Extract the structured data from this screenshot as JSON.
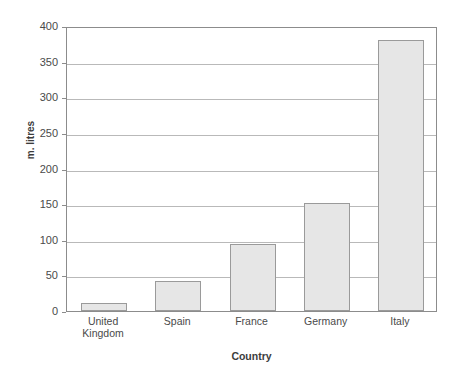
{
  "chart_data": {
    "type": "bar",
    "title": "",
    "xlabel": "Country",
    "ylabel": "m. litres",
    "categories": [
      "United Kingdom",
      "Spain",
      "France",
      "Germany",
      "Italy"
    ],
    "category_lines": [
      [
        "United",
        "Kingdom"
      ],
      [
        "Spain"
      ],
      [
        "France"
      ],
      [
        "Germany"
      ],
      [
        "Italy"
      ]
    ],
    "values": [
      11,
      42,
      94,
      151,
      380
    ],
    "ylim": [
      0,
      400
    ],
    "ytick_values": [
      0,
      50,
      100,
      150,
      200,
      250,
      300,
      350,
      400
    ],
    "ytick_labels": [
      "0",
      "50",
      "100",
      "150",
      "200",
      "250",
      "300",
      "350",
      "400"
    ],
    "grid": true,
    "legend": false,
    "bar_fill": "#e6e6e6",
    "bar_border": "#9a9a9a",
    "gridline_color": "#b9b9b9",
    "axis_color": "#8c8c8c",
    "background": "#ffffff"
  }
}
